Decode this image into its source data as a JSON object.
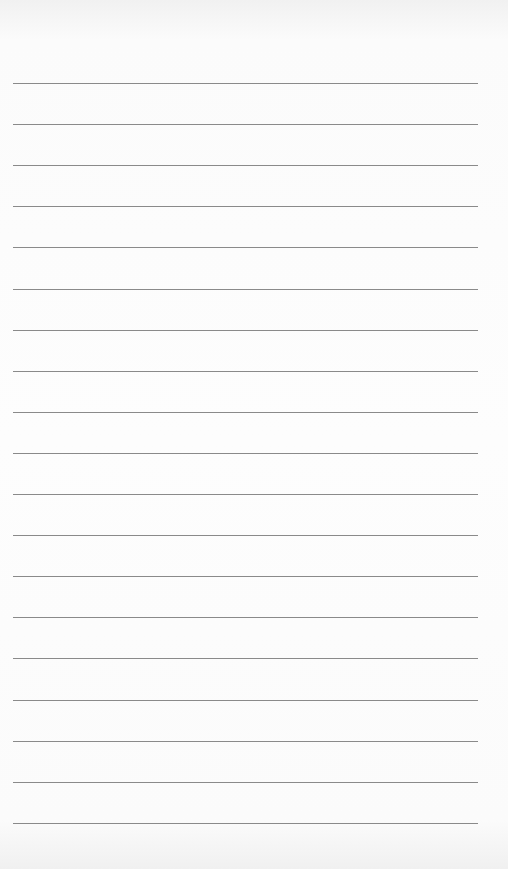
{
  "page": {
    "type": "lined-paper",
    "background_color": "#fbfbfb",
    "line_color": "#8a8a8a",
    "line_count": 19,
    "first_line_y": 83,
    "line_spacing": 41.1,
    "line_left": 13,
    "line_width": 465
  }
}
